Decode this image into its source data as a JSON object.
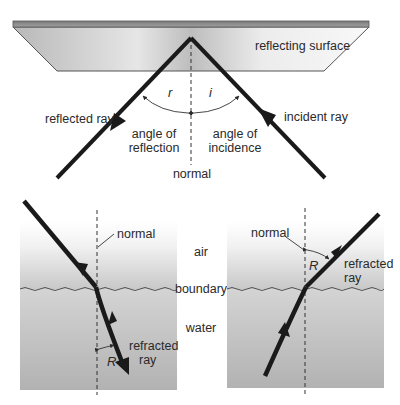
{
  "reflection": {
    "surface_label": "reflecting surface",
    "reflected_ray_label": "reflected ray",
    "incident_ray_label": "incident ray",
    "angle_r_symbol": "r",
    "angle_i_symbol": "i",
    "angle_reflection_line1": "angle of",
    "angle_reflection_line2": "reflection",
    "angle_incidence_line1": "angle of",
    "angle_incidence_line2": "incidence",
    "normal_label": "normal"
  },
  "refraction_left": {
    "normal_label": "normal",
    "refracted_line1": "refracted",
    "refracted_line2": "ray",
    "angle_symbol": "R"
  },
  "refraction_right": {
    "normal_label": "normal",
    "refracted_line1": "refracted",
    "refracted_line2": "ray",
    "angle_symbol": "R"
  },
  "media": {
    "air_label": "air",
    "boundary_label": "boundary",
    "water_label": "water"
  },
  "colors": {
    "ray": "#1a1a1a",
    "surface_edge": "#555555",
    "text": "#2a2a2a"
  }
}
